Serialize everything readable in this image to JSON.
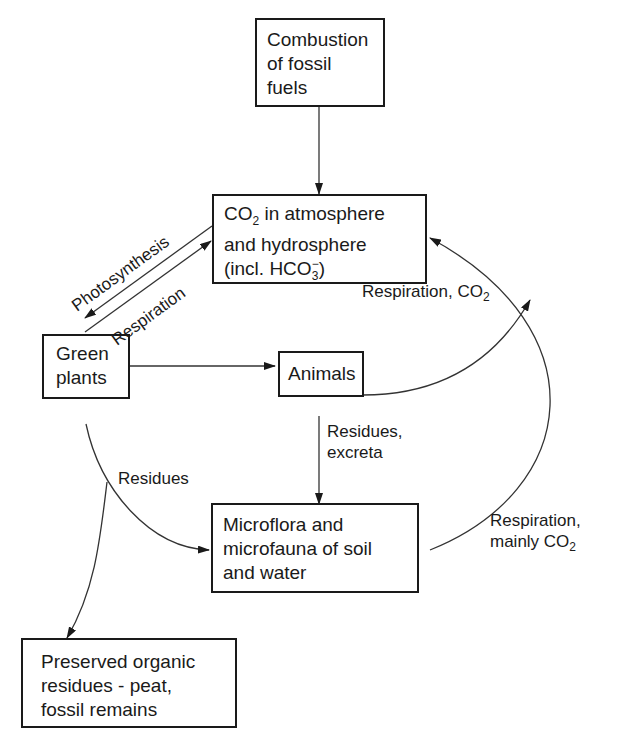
{
  "nodes": {
    "combustion": {
      "lines": [
        "Combustion",
        "of fossil",
        "fuels"
      ]
    },
    "atmosphere": {
      "line1_pre": "CO",
      "line1_sub": "2",
      "line1_post": " in atmosphere",
      "line2": "and hydrosphere",
      "line3_pre": "(incl. HCO",
      "line3_sub": "3",
      "line3_sup": "−",
      "line3_post": ")"
    },
    "green_plants": {
      "lines": [
        "Green",
        "plants"
      ]
    },
    "animals": {
      "label": "Animals"
    },
    "microflora": {
      "lines": [
        "Microflora and",
        "microfauna of soil",
        "and water"
      ]
    },
    "preserved": {
      "lines": [
        "Preserved organic",
        "residues - peat,",
        "fossil remains"
      ]
    }
  },
  "edges": {
    "photosynthesis": "Photosynthesis",
    "respiration_plants": "Respiration",
    "respiration_animals_pre": "Respiration, CO",
    "respiration_animals_sub": "2",
    "residues_excreta": [
      "Residues,",
      "excreta"
    ],
    "residues_plants": "Residues",
    "respiration_micro_line1": "Respiration,",
    "respiration_micro_line2_pre": "mainly CO",
    "respiration_micro_line2_sub": "2"
  }
}
